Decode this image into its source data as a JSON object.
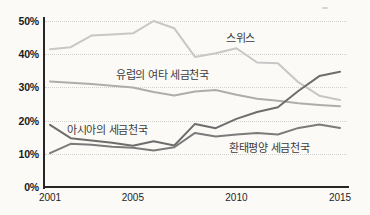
{
  "chart_data": {
    "type": "line",
    "title": "",
    "x": [
      2001,
      2002,
      2003,
      2004,
      2005,
      2006,
      2007,
      2008,
      2009,
      2010,
      2011,
      2012,
      2013,
      2014,
      2015
    ],
    "x_axis": {
      "tick_labels": [
        "2001",
        "2005",
        "2010",
        "2015"
      ],
      "tick_years": [
        2001,
        2005,
        2010,
        2015
      ]
    },
    "y_axis": {
      "tick_labels": [
        "0%",
        "10%",
        "20%",
        "30%",
        "40%",
        "50%"
      ],
      "tick_values": [
        0,
        10,
        20,
        30,
        40,
        50
      ],
      "ylim": [
        0,
        50
      ],
      "unit": "%"
    },
    "grid": true,
    "legend_position": "inline-labels",
    "series": [
      {
        "name": "스위스",
        "color": "#c7c7c7",
        "values": [
          41.5,
          42.1,
          45.6,
          45.9,
          46.3,
          50.0,
          47.8,
          39.2,
          40.3,
          41.8,
          37.5,
          37.3,
          31.5,
          27.5,
          26.2
        ]
      },
      {
        "name": "유럽의 여타 세금천국",
        "color": "#adadab",
        "values": [
          31.8,
          31.4,
          31.0,
          30.5,
          30.0,
          28.6,
          27.6,
          28.8,
          29.2,
          27.8,
          26.6,
          26.0,
          25.2,
          24.7,
          24.3
        ]
      },
      {
        "name": "아시아의 세금천국",
        "color": "#6d6d6d",
        "values": [
          18.7,
          14.7,
          14.0,
          13.3,
          12.4,
          13.8,
          12.5,
          19.0,
          17.7,
          20.5,
          22.6,
          24.0,
          29.0,
          33.4,
          34.7
        ]
      },
      {
        "name": "환태평양 세금천국",
        "color": "#7b7b7b",
        "values": [
          10.2,
          13.0,
          12.7,
          12.1,
          11.8,
          11.0,
          12.0,
          16.3,
          15.2,
          15.8,
          16.3,
          15.8,
          17.8,
          18.8,
          17.8
        ]
      }
    ]
  }
}
